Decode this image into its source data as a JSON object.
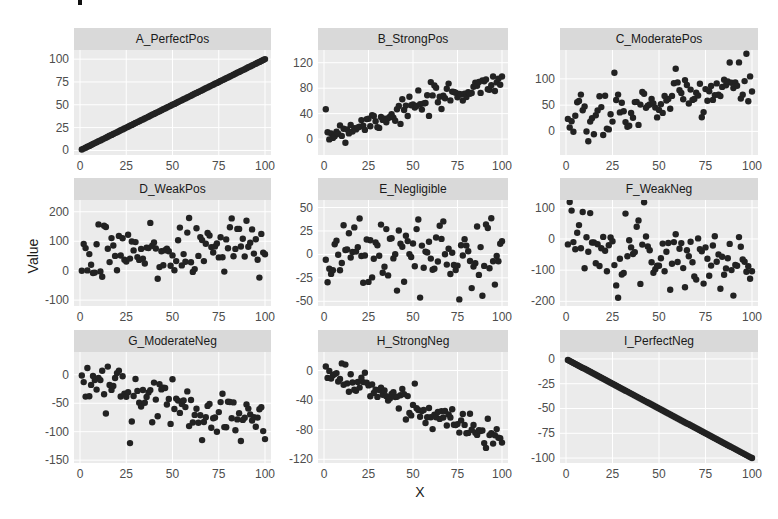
{
  "figure": {
    "xlabel": "X",
    "ylabel": "Value",
    "point_color": "#222222",
    "strip_color": "#d9d9d9",
    "panel_bg": "#ebebeb"
  },
  "chart_data": {
    "type": "scatter",
    "layout": "facet_wrap 3x3, free y scales",
    "xlabel": "X",
    "ylabel": "Value",
    "grid": true,
    "legend": "none",
    "panels": [
      {
        "name": "A_PerfectPos",
        "xlim": [
          0,
          100
        ],
        "ylim": [
          -5,
          110
        ],
        "yticks": [
          0,
          25,
          50,
          75,
          100
        ],
        "xticks": [
          0,
          25,
          50,
          75,
          100
        ],
        "relation": "y = x",
        "trend": {
          "slope": 1,
          "intercept": 0,
          "noise": 0
        }
      },
      {
        "name": "B_StrongPos",
        "xlim": [
          0,
          100
        ],
        "ylim": [
          -25,
          140
        ],
        "yticks": [
          0,
          40,
          80,
          120
        ],
        "xticks": [
          0,
          25,
          50,
          75,
          100
        ],
        "relation": "strong positive",
        "trend": {
          "slope": 0.9,
          "intercept": 5,
          "noise": 14
        }
      },
      {
        "name": "C_ModeratePos",
        "xlim": [
          0,
          100
        ],
        "ylim": [
          -45,
          155
        ],
        "yticks": [
          0,
          50,
          100
        ],
        "xticks": [
          0,
          25,
          50,
          75,
          100
        ],
        "relation": "moderate positive",
        "trend": {
          "slope": 0.85,
          "intercept": 10,
          "noise": 32
        }
      },
      {
        "name": "D_WeakPos",
        "xlim": [
          0,
          100
        ],
        "ylim": [
          -120,
          240
        ],
        "yticks": [
          -100,
          0,
          100,
          200
        ],
        "xticks": [
          0,
          25,
          50,
          75,
          100
        ],
        "relation": "weak positive",
        "trend": {
          "slope": 0.7,
          "intercept": 35,
          "noise": 75
        }
      },
      {
        "name": "E_Negligible",
        "xlim": [
          0,
          100
        ],
        "ylim": [
          -55,
          58
        ],
        "yticks": [
          -50,
          -25,
          0,
          25,
          50
        ],
        "xticks": [
          0,
          25,
          50,
          75,
          100
        ],
        "relation": "none",
        "trend": {
          "slope": 0,
          "intercept": 2,
          "noise": 27
        }
      },
      {
        "name": "F_WeakNeg",
        "xlim": [
          0,
          100
        ],
        "ylim": [
          -215,
          125
        ],
        "yticks": [
          -200,
          -100,
          0,
          100
        ],
        "xticks": [
          0,
          25,
          50,
          75,
          100
        ],
        "relation": "weak negative",
        "trend": {
          "slope": -1.0,
          "intercept": 10,
          "noise": 65
        }
      },
      {
        "name": "G_ModerateNeg",
        "xlim": [
          0,
          100
        ],
        "ylim": [
          -155,
          40
        ],
        "yticks": [
          -150,
          -100,
          -50,
          0
        ],
        "xticks": [
          0,
          25,
          50,
          75,
          100
        ],
        "relation": "moderate negative",
        "trend": {
          "slope": -0.75,
          "intercept": -10,
          "noise": 28
        }
      },
      {
        "name": "H_StrongNeg",
        "xlim": [
          0,
          100
        ],
        "ylim": [
          -125,
          25
        ],
        "yticks": [
          -120,
          -80,
          -40,
          0
        ],
        "xticks": [
          0,
          25,
          50,
          75,
          100
        ],
        "relation": "strong negative",
        "trend": {
          "slope": -0.95,
          "intercept": 0,
          "noise": 13
        }
      },
      {
        "name": "I_PerfectNeg",
        "xlim": [
          0,
          100
        ],
        "ylim": [
          -105,
          7
        ],
        "yticks": [
          -100,
          -75,
          -50,
          -25,
          0
        ],
        "xticks": [
          0,
          25,
          50,
          75,
          100
        ],
        "relation": "y = -x",
        "trend": {
          "slope": -1,
          "intercept": 0,
          "noise": 0
        }
      }
    ],
    "n_points_per_panel": 100
  }
}
